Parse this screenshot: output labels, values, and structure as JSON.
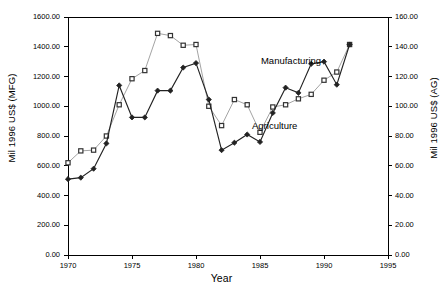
{
  "chart_data": {
    "type": "line",
    "title": "",
    "xlabel": "Year",
    "ylabel": "Mil 1996 US$ (MFG)",
    "ylabel_right": "Mil 1996 US$ (AG)",
    "xlim": [
      1970,
      1995
    ],
    "ylim": [
      0,
      1600
    ],
    "ylim_right": [
      0,
      160
    ],
    "grid": false,
    "legend": "inline-annotations",
    "x": [
      1970,
      1971,
      1972,
      1973,
      1974,
      1975,
      1976,
      1977,
      1978,
      1979,
      1980,
      1981,
      1982,
      1983,
      1984,
      1985,
      1986,
      1987,
      1988,
      1989,
      1990,
      1991,
      1992
    ],
    "series": [
      {
        "name": "Manufacturing",
        "axis": "left",
        "marker": "square",
        "color": "#999999",
        "values": [
          620,
          700,
          705,
          800,
          1010,
          1185,
          1240,
          1490,
          1475,
          1410,
          1415,
          1000,
          870,
          1045,
          1010,
          825,
          995,
          1010,
          1050,
          1080,
          1175,
          1230,
          1415
        ]
      },
      {
        "name": "Agriculture",
        "axis": "right",
        "marker": "diamond",
        "color": "#222222",
        "values": [
          51.0,
          52.0,
          58.0,
          75.0,
          114.0,
          92.5,
          92.5,
          110.5,
          110.5,
          126.0,
          129.0,
          104.5,
          70.5,
          75.5,
          81.0,
          76.0,
          95.5,
          112.5,
          109.0,
          128.5,
          130.0,
          114.5,
          141.5
        ]
      }
    ],
    "yticks_left": [
      "1600.00",
      "1400.00",
      "1200.00",
      "1000.00",
      "800.00",
      "600.00",
      "400.00",
      "200.00",
      "0.00"
    ],
    "yticks_right": [
      "160.00",
      "140.00",
      "120.00",
      "100.00",
      "80.00",
      "60.00",
      "40.00",
      "20.00",
      "0.00"
    ],
    "xticks": [
      "1970",
      "1975",
      "1980",
      "1985",
      "1990",
      "1995"
    ],
    "annotations": [
      {
        "text": "Manufacturing",
        "x": 1988.2,
        "y_px": 55
      },
      {
        "text": "Agriculture",
        "x": 1987.5,
        "y_px": 120
      }
    ]
  },
  "axes": {
    "left_title": "Mil 1996 US$ (MFG)",
    "right_title": "Mil 1996 US$ (AG)",
    "x_title": "Year"
  },
  "labels": {
    "manufacturing": "Manufacturing",
    "agriculture": "Agriculture"
  }
}
